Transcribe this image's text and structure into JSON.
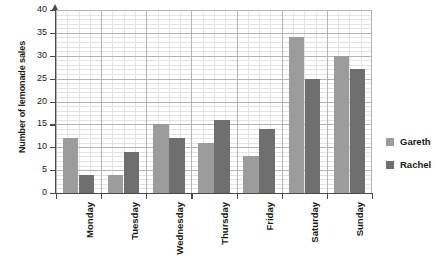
{
  "chart_data": {
    "type": "bar",
    "title": "",
    "xlabel": "",
    "ylabel": "Number of lemonade sales",
    "categories": [
      "Monday",
      "Tuesday",
      "Wednesday",
      "Thursday",
      "Friday",
      "Saturday",
      "Sunday"
    ],
    "series": [
      {
        "name": "Gareth",
        "color": "#9c9c9c",
        "values": [
          12,
          4,
          15,
          11,
          8,
          34,
          30
        ]
      },
      {
        "name": "Rachel",
        "color": "#6f6f6f",
        "values": [
          4,
          9,
          12,
          16,
          14,
          25,
          27
        ]
      }
    ],
    "ylim": [
      0,
      40
    ],
    "ytick_labels": [
      "0",
      "5",
      "10",
      "15",
      "20",
      "25",
      "30",
      "35",
      "40"
    ],
    "ytick_values": [
      0,
      5,
      10,
      15,
      20,
      25,
      30,
      35,
      40
    ],
    "y_major_step": 5,
    "y_minor_step": 1,
    "grid": true,
    "legend_position": "right"
  },
  "legend": {
    "entries": [
      {
        "label": "Gareth",
        "color": "#9c9c9c"
      },
      {
        "label": "Rachel",
        "color": "#6f6f6f"
      }
    ]
  },
  "axes": {
    "y_title": "Number of lemonade sales"
  },
  "colors": {
    "gareth": "#9c9c9c",
    "rachel": "#6f6f6f",
    "axis": "#4a4a4a",
    "grid_major": "#b4b4b4",
    "grid_minor": "#e3e3e3",
    "text": "#1a1a1a",
    "background": "#ffffff"
  }
}
